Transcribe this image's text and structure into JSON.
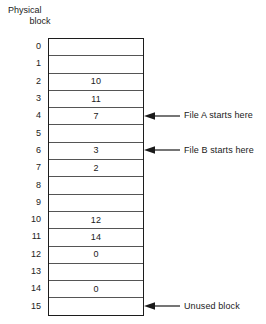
{
  "header": {
    "line1": "Physical",
    "line2": "block"
  },
  "table": {
    "rows": [
      {
        "index": "0",
        "value": ""
      },
      {
        "index": "1",
        "value": ""
      },
      {
        "index": "2",
        "value": "10"
      },
      {
        "index": "3",
        "value": "11"
      },
      {
        "index": "4",
        "value": "7"
      },
      {
        "index": "5",
        "value": ""
      },
      {
        "index": "6",
        "value": "3"
      },
      {
        "index": "7",
        "value": "2"
      },
      {
        "index": "8",
        "value": ""
      },
      {
        "index": "9",
        "value": ""
      },
      {
        "index": "10",
        "value": "12"
      },
      {
        "index": "11",
        "value": "14"
      },
      {
        "index": "12",
        "value": "0"
      },
      {
        "index": "13",
        "value": ""
      },
      {
        "index": "14",
        "value": "0"
      },
      {
        "index": "15",
        "value": ""
      }
    ]
  },
  "annotations": [
    {
      "label": "File A starts here",
      "row": "4",
      "icon": "left-arrow-icon"
    },
    {
      "label": "File B starts here",
      "row": "6",
      "icon": "left-arrow-icon"
    },
    {
      "label": "Unused block",
      "row": "15",
      "icon": "left-arrow-icon"
    }
  ],
  "colors": {
    "outer_border": "#1c1c1c",
    "inner_line": "#555555",
    "text": "#1a1a1a",
    "background": "#ffffff"
  }
}
